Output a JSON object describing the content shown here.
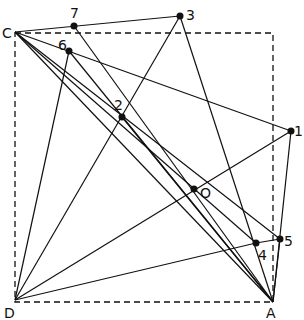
{
  "diagram": {
    "frame": {
      "x1": 15,
      "y1": 33,
      "x2": 273,
      "y2": 302,
      "style": "dashed"
    },
    "points": [
      {
        "id": "C",
        "label": "C",
        "x": 15,
        "y": 32,
        "lx": 2,
        "ly": 38,
        "dot": false
      },
      {
        "id": "D",
        "label": "D",
        "x": 15,
        "y": 300,
        "lx": 4,
        "ly": 318,
        "dot": false
      },
      {
        "id": "A",
        "label": "A",
        "x": 273,
        "y": 302,
        "lx": 266,
        "ly": 318,
        "dot": false
      },
      {
        "id": "7",
        "label": "7",
        "x": 74,
        "y": 26,
        "lx": 70,
        "ly": 18,
        "dot": true
      },
      {
        "id": "6",
        "label": "6",
        "x": 69,
        "y": 51,
        "lx": 58,
        "ly": 50,
        "dot": true
      },
      {
        "id": "3",
        "label": "3",
        "x": 180,
        "y": 16,
        "lx": 186,
        "ly": 20,
        "dot": true
      },
      {
        "id": "1",
        "label": "1",
        "x": 291,
        "y": 131,
        "lx": 294,
        "ly": 136,
        "dot": true
      },
      {
        "id": "2",
        "label": "2",
        "x": 122,
        "y": 117,
        "lx": 114,
        "ly": 110,
        "dot": true
      },
      {
        "id": "O",
        "label": "O",
        "x": 194,
        "y": 189,
        "lx": 200,
        "ly": 198,
        "dot": true
      },
      {
        "id": "4",
        "label": "4",
        "x": 256,
        "y": 243,
        "lx": 258,
        "ly": 260,
        "dot": true
      },
      {
        "id": "5",
        "label": "5",
        "x": 280,
        "y": 239,
        "lx": 284,
        "ly": 246,
        "dot": true
      }
    ],
    "lines": [
      [
        "C",
        "3"
      ],
      [
        "C",
        "1"
      ],
      [
        "C",
        "A"
      ],
      [
        "C",
        "5"
      ],
      [
        "C",
        "4"
      ],
      [
        "7",
        "A"
      ],
      [
        "6",
        "A"
      ],
      [
        "6",
        "D"
      ],
      [
        "3",
        "D"
      ],
      [
        "3",
        "A"
      ],
      [
        "1",
        "D"
      ],
      [
        "1",
        "A"
      ],
      [
        "4",
        "D"
      ],
      [
        "4",
        "5"
      ],
      [
        "5",
        "A"
      ],
      [
        "2",
        "A"
      ]
    ],
    "colors": {
      "ink": "#111111",
      "background": "#ffffff"
    }
  }
}
